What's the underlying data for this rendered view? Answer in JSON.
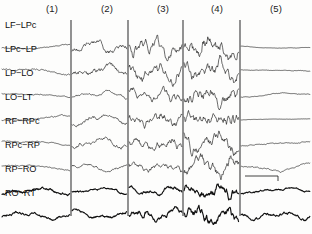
{
  "figure": {
    "type": "eeg-multichannel-trace",
    "background_color": "#fdfdfc",
    "trace_color": "#111111",
    "divider_color": "#3a3a3a",
    "width": 312,
    "height": 234
  },
  "epochs": [
    {
      "label": "(1)",
      "x": 46,
      "description": "baseline slow low-amplitude activity"
    },
    {
      "label": "(2)",
      "x": 101,
      "description": "rhythmic build-up"
    },
    {
      "label": "(3)",
      "x": 157,
      "description": "sustained fast rhythmic discharge"
    },
    {
      "label": "(4)",
      "x": 211,
      "description": "maximal high-amplitude spike-wave"
    },
    {
      "label": "(5)",
      "x": 270,
      "description": "post-ictal suppression / flattening"
    }
  ],
  "dividers": [
    {
      "x": 71,
      "y_top": 20,
      "y_bottom": 216
    },
    {
      "x": 128,
      "y_top": 20,
      "y_bottom": 216
    },
    {
      "x": 183,
      "y_top": 20,
      "y_bottom": 216
    },
    {
      "x": 240,
      "y_top": 20,
      "y_bottom": 216
    }
  ],
  "channels": [
    {
      "label": "LF−LPc",
      "label_x": 5,
      "label_y": 27,
      "baseline_y": 47,
      "thick": false
    },
    {
      "label": "LPc−LP",
      "label_x": 5,
      "label_y": 51,
      "baseline_y": 71,
      "thick": false
    },
    {
      "label": "LP−LO",
      "label_x": 5,
      "label_y": 75,
      "baseline_y": 95,
      "thick": false
    },
    {
      "label": "LO−LT",
      "label_x": 5,
      "label_y": 99,
      "baseline_y": 119,
      "thick": false
    },
    {
      "label": "RF−RPc",
      "label_x": 5,
      "label_y": 123,
      "baseline_y": 143,
      "thick": false
    },
    {
      "label": "RPc−RP",
      "label_x": 5,
      "label_y": 147,
      "baseline_y": 167,
      "thick": false
    },
    {
      "label": "RP−RO",
      "label_x": 5,
      "label_y": 171,
      "baseline_y": 191,
      "thick": true
    },
    {
      "label": "RO−RT",
      "label_x": 5,
      "label_y": 195,
      "baseline_y": 215,
      "thick": true
    }
  ],
  "scale_bar": {
    "x_start": 245,
    "x_end": 278,
    "y": 176,
    "tick_height": 5,
    "name": "time-scale-bar"
  },
  "chart_data": {
    "type": "line",
    "title": "",
    "xlabel": "",
    "ylabel": "",
    "grid": false,
    "legend": "none",
    "x_range": [
      0,
      312
    ],
    "note": "Eight-channel bipolar EEG montage displayed across five sequential epochs separated by vertical rules.",
    "categories": [
      "(1)",
      "(2)",
      "(3)",
      "(4)",
      "(5)"
    ],
    "series": [
      {
        "name": "LF−LPc",
        "amplitudes": [
          3.0,
          7.5,
          8.0,
          10.5,
          1.6
        ],
        "frequencies": [
          1.2,
          3.4,
          4.6,
          4.2,
          0.9
        ],
        "roughness": [
          0.25,
          0.55,
          0.85,
          0.8,
          0.18
        ]
      },
      {
        "name": "LPc−LP",
        "amplitudes": [
          4.2,
          6.5,
          7.0,
          10.0,
          2.0
        ],
        "frequencies": [
          1.4,
          3.0,
          4.8,
          4.0,
          1.0
        ],
        "roughness": [
          0.3,
          0.6,
          0.9,
          0.75,
          0.2
        ]
      },
      {
        "name": "LP−LO",
        "amplitudes": [
          3.2,
          4.6,
          5.2,
          8.2,
          2.4
        ],
        "frequencies": [
          1.1,
          2.6,
          5.2,
          4.6,
          1.2
        ],
        "roughness": [
          0.22,
          0.45,
          0.95,
          0.88,
          0.26
        ]
      },
      {
        "name": "LO−LT",
        "amplitudes": [
          4.0,
          5.6,
          6.0,
          6.6,
          1.5
        ],
        "frequencies": [
          1.3,
          3.2,
          5.6,
          6.2,
          0.8
        ],
        "roughness": [
          0.28,
          0.5,
          1.0,
          1.1,
          0.16
        ]
      },
      {
        "name": "RF−RPc",
        "amplitudes": [
          3.4,
          6.0,
          6.4,
          9.4,
          4.2
        ],
        "frequencies": [
          1.2,
          3.0,
          4.4,
          4.0,
          1.1
        ],
        "roughness": [
          0.26,
          0.52,
          0.82,
          0.78,
          0.22
        ]
      },
      {
        "name": "RPc−RP",
        "amplitudes": [
          3.6,
          5.4,
          5.0,
          8.0,
          4.6
        ],
        "frequencies": [
          1.0,
          2.4,
          4.0,
          4.4,
          1.4
        ],
        "roughness": [
          0.24,
          0.42,
          0.76,
          0.86,
          0.3
        ]
      },
      {
        "name": "RP−RO",
        "amplitudes": [
          3.8,
          4.4,
          4.2,
          6.2,
          3.0
        ],
        "frequencies": [
          2.4,
          2.2,
          3.6,
          5.0,
          2.0
        ],
        "roughness": [
          0.55,
          0.38,
          0.7,
          0.95,
          0.45
        ]
      },
      {
        "name": "RO−RT",
        "amplitudes": [
          3.6,
          5.0,
          5.4,
          6.8,
          4.4
        ],
        "frequencies": [
          2.8,
          2.8,
          4.2,
          5.6,
          3.0
        ],
        "roughness": [
          0.6,
          0.46,
          0.8,
          1.05,
          0.6
        ]
      }
    ]
  }
}
